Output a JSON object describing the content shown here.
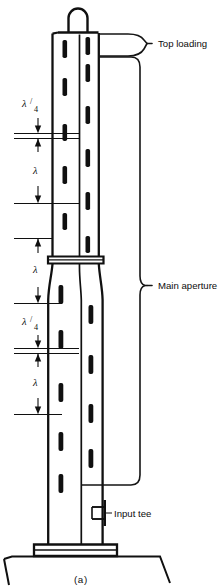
{
  "figure": {
    "caption": "(a)",
    "title_alt": "Slotted-mast antenna with top loading and main aperture"
  },
  "callouts": [
    {
      "id": "top-loading",
      "label": "Top loading",
      "x": 158,
      "y": 43
    },
    {
      "id": "main-aperture",
      "label": "Main aperture",
      "x": 158,
      "y": 285
    },
    {
      "id": "input-tee",
      "label": "Input tee",
      "x": 117,
      "y": 513
    }
  ],
  "dimensions": [
    {
      "id": "quarter-wave-upper",
      "symbol": "λ",
      "divisor": "4",
      "text": "λ/4",
      "label_x": 27,
      "label_y": 107,
      "top": 100,
      "bottom": 133
    },
    {
      "id": "full-wave-upper",
      "symbol": "λ",
      "divisor": "",
      "text": "λ",
      "label_x": 33,
      "label_y": 172,
      "top": 138,
      "bottom": 203
    },
    {
      "id": "full-wave-middle",
      "symbol": "λ",
      "divisor": "",
      "text": "λ",
      "label_x": 33,
      "label_y": 270,
      "top": 238,
      "bottom": 303
    },
    {
      "id": "quarter-wave-lower",
      "symbol": "λ",
      "divisor": "4",
      "text": "λ/4",
      "label_x": 27,
      "label_y": 325,
      "top": 318,
      "bottom": 348
    },
    {
      "id": "full-wave-lower",
      "symbol": "λ",
      "divisor": "",
      "text": "λ",
      "label_x": 33,
      "label_y": 382,
      "top": 353,
      "bottom": 414
    }
  ],
  "colors": {
    "ink": "#101010",
    "paper": "#ffffff"
  },
  "mast": {
    "upper_left_x": 52,
    "upper_right_x": 99,
    "flange_y": 258,
    "base_y": 545,
    "top_y": 32
  },
  "slots": {
    "front_column": [
      {
        "y": 40,
        "h": 18
      },
      {
        "y": 78,
        "h": 18
      },
      {
        "y": 124,
        "h": 17
      },
      {
        "y": 166,
        "h": 18
      },
      {
        "y": 213,
        "h": 17
      },
      {
        "y": 285,
        "h": 19
      },
      {
        "y": 330,
        "h": 19
      },
      {
        "y": 383,
        "h": 19
      },
      {
        "y": 432,
        "h": 19
      },
      {
        "y": 474,
        "h": 19
      }
    ],
    "back_column": [
      {
        "y": 64,
        "h": 18
      },
      {
        "y": 106,
        "h": 18
      },
      {
        "y": 149,
        "h": 18
      },
      {
        "y": 192,
        "h": 18
      },
      {
        "y": 236,
        "h": 17
      },
      {
        "y": 305,
        "h": 19
      },
      {
        "y": 355,
        "h": 19
      },
      {
        "y": 404,
        "h": 19
      },
      {
        "y": 449,
        "h": 19
      }
    ]
  }
}
